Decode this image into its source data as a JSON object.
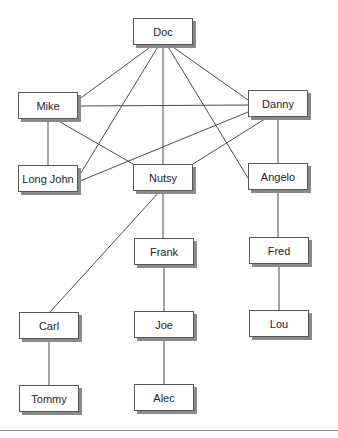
{
  "diagram": {
    "type": "sociogram / network graph",
    "nodes": [
      {
        "id": "doc",
        "label": "Doc",
        "x": 133,
        "y": 18
      },
      {
        "id": "mike",
        "label": "Mike",
        "x": 18,
        "y": 92
      },
      {
        "id": "danny",
        "label": "Danny",
        "x": 248,
        "y": 90
      },
      {
        "id": "longjohn",
        "label": "Long John",
        "x": 18,
        "y": 165
      },
      {
        "id": "nutsy",
        "label": "Nutsy",
        "x": 133,
        "y": 164
      },
      {
        "id": "angelo",
        "label": "Angelo",
        "x": 248,
        "y": 163
      },
      {
        "id": "frank",
        "label": "Frank",
        "x": 134,
        "y": 238
      },
      {
        "id": "fred",
        "label": "Fred",
        "x": 249,
        "y": 237
      },
      {
        "id": "carl",
        "label": "Carl",
        "x": 19,
        "y": 312
      },
      {
        "id": "joe",
        "label": "Joe",
        "x": 134,
        "y": 311
      },
      {
        "id": "lou",
        "label": "Lou",
        "x": 249,
        "y": 310
      },
      {
        "id": "tommy",
        "label": "Tommy",
        "x": 19,
        "y": 385
      },
      {
        "id": "alec",
        "label": "Alec",
        "x": 134,
        "y": 384
      }
    ],
    "edges": [
      {
        "from": "Doc",
        "to": "Mike",
        "x1": 153,
        "y1": 45,
        "x2": 78,
        "y2": 100
      },
      {
        "from": "Doc",
        "to": "Danny",
        "x1": 170,
        "y1": 45,
        "x2": 248,
        "y2": 100
      },
      {
        "from": "Doc",
        "to": "Long John",
        "x1": 159,
        "y1": 45,
        "x2": 79,
        "y2": 176
      },
      {
        "from": "Doc",
        "to": "Nutsy",
        "x1": 163,
        "y1": 45,
        "x2": 163,
        "y2": 164
      },
      {
        "from": "Doc",
        "to": "Angelo",
        "x1": 167,
        "y1": 45,
        "x2": 248,
        "y2": 178
      },
      {
        "from": "Mike",
        "to": "Danny",
        "x1": 78,
        "y1": 106,
        "x2": 248,
        "y2": 105
      },
      {
        "from": "Mike",
        "to": "Long John",
        "x1": 48,
        "y1": 119,
        "x2": 48,
        "y2": 165
      },
      {
        "from": "Mike",
        "to": "Nutsy",
        "x1": 55,
        "y1": 119,
        "x2": 133,
        "y2": 164
      },
      {
        "from": "Danny",
        "to": "Long John",
        "x1": 248,
        "y1": 112,
        "x2": 80,
        "y2": 181
      },
      {
        "from": "Danny",
        "to": "Nutsy",
        "x1": 268,
        "y1": 117,
        "x2": 193,
        "y2": 164
      },
      {
        "from": "Danny",
        "to": "Angelo",
        "x1": 278,
        "y1": 117,
        "x2": 278,
        "y2": 163
      },
      {
        "from": "Nutsy",
        "to": "Carl",
        "x1": 160,
        "y1": 191,
        "x2": 50,
        "y2": 312
      },
      {
        "from": "Nutsy",
        "to": "Frank",
        "x1": 163,
        "y1": 191,
        "x2": 163,
        "y2": 238
      },
      {
        "from": "Angelo",
        "to": "Fred",
        "x1": 278,
        "y1": 190,
        "x2": 278,
        "y2": 237
      },
      {
        "from": "Frank",
        "to": "Joe",
        "x1": 164,
        "y1": 265,
        "x2": 164,
        "y2": 311
      },
      {
        "from": "Fred",
        "to": "Lou",
        "x1": 279,
        "y1": 264,
        "x2": 279,
        "y2": 310
      },
      {
        "from": "Carl",
        "to": "Tommy",
        "x1": 49,
        "y1": 339,
        "x2": 49,
        "y2": 385
      },
      {
        "from": "Joe",
        "to": "Alec",
        "x1": 164,
        "y1": 338,
        "x2": 164,
        "y2": 384
      }
    ]
  },
  "colors": {
    "edge": "#4a4a4a",
    "node_border": "#555555",
    "node_shadow": "#8a8a8a",
    "text": "#222222",
    "background": "#ffffff"
  }
}
